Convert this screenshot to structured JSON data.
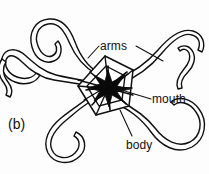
{
  "figure": {
    "panel_label": "(b)",
    "background_color": "#fdfdfd",
    "ink_color": "#111111",
    "mouth_fill_color": "#0a0a0a"
  },
  "labels": {
    "arms": "arms",
    "mouth": "mouth",
    "body": "body"
  },
  "anatomy": {
    "arm_count": 5,
    "disc_shape": "pentagon",
    "mouth_shape": "star"
  }
}
